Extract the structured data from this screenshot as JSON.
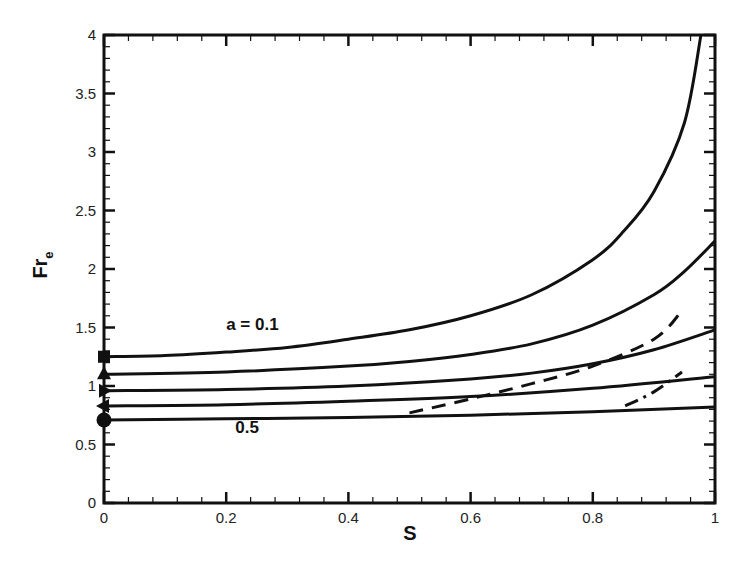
{
  "chart_data": {
    "type": "line",
    "title": "",
    "xlabel": "S",
    "ylabel": "Fr",
    "ylabel_subscript": "e",
    "xlim": [
      0,
      1
    ],
    "ylim": [
      0,
      4
    ],
    "grid": false,
    "legend": null,
    "x_ticks": [
      0,
      0.2,
      0.4,
      0.6,
      0.8,
      1
    ],
    "x_tick_labels": [
      "0",
      "0.2",
      "0.4",
      "0.6",
      "0.8",
      "1"
    ],
    "y_ticks": [
      0,
      0.5,
      1,
      1.5,
      2,
      2.5,
      3,
      3.5,
      4
    ],
    "y_tick_labels": [
      "0",
      "0.5",
      "1",
      "1.5",
      "2",
      "2.5",
      "3",
      "3.5",
      "4"
    ],
    "annotations": [
      {
        "text": "a = 0.1",
        "x": 0.2,
        "y": 1.48
      },
      {
        "text": "0.5",
        "x": 0.215,
        "y": 0.6
      }
    ],
    "series": [
      {
        "name": "a = 0.1",
        "style": "solid",
        "marker": "square",
        "x": [
          0,
          0.1,
          0.2,
          0.3,
          0.4,
          0.5,
          0.6,
          0.7,
          0.8,
          0.85,
          0.9,
          0.95,
          0.977
        ],
        "y": [
          1.25,
          1.26,
          1.29,
          1.33,
          1.4,
          1.48,
          1.6,
          1.78,
          2.08,
          2.32,
          2.66,
          3.25,
          4.0
        ]
      },
      {
        "name": "curve 2",
        "style": "solid",
        "marker": "triangle-up",
        "x": [
          0,
          0.2,
          0.4,
          0.5,
          0.6,
          0.7,
          0.8,
          0.9,
          0.95,
          1.0
        ],
        "y": [
          1.1,
          1.12,
          1.17,
          1.21,
          1.27,
          1.36,
          1.52,
          1.78,
          1.98,
          2.24
        ]
      },
      {
        "name": "curve 3",
        "style": "solid",
        "marker": "triangle-right",
        "x": [
          0,
          0.2,
          0.4,
          0.6,
          0.7,
          0.8,
          0.9,
          1.0
        ],
        "y": [
          0.96,
          0.97,
          1.0,
          1.06,
          1.11,
          1.19,
          1.31,
          1.48
        ]
      },
      {
        "name": "curve 4",
        "style": "solid",
        "marker": "triangle-left",
        "x": [
          0,
          0.2,
          0.4,
          0.6,
          0.8,
          1.0
        ],
        "y": [
          0.83,
          0.84,
          0.87,
          0.91,
          0.98,
          1.08
        ]
      },
      {
        "name": "a = 0.5",
        "style": "solid",
        "marker": "circle",
        "x": [
          0,
          0.2,
          0.4,
          0.6,
          0.8,
          1.0
        ],
        "y": [
          0.71,
          0.72,
          0.73,
          0.75,
          0.78,
          0.82
        ]
      },
      {
        "name": "dashed",
        "style": "dashed",
        "marker": null,
        "x": [
          0.5,
          0.6,
          0.7,
          0.8,
          0.9,
          0.944
        ],
        "y": [
          0.77,
          0.89,
          1.02,
          1.17,
          1.4,
          1.63
        ]
      },
      {
        "name": "dash-dot",
        "style": "dashdot",
        "marker": null,
        "x": [
          0.853,
          0.9,
          0.946
        ],
        "y": [
          0.83,
          0.95,
          1.12
        ]
      }
    ]
  },
  "layout": {
    "plot_left": 104,
    "plot_right": 715,
    "plot_top": 35,
    "plot_bottom": 503,
    "line_color": "#111111"
  }
}
